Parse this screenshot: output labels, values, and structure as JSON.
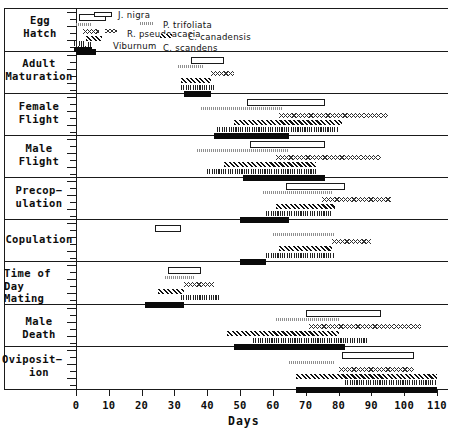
{
  "chart_data": {
    "type": "bar",
    "title": "",
    "xlabel": "Days",
    "ylabel": "",
    "xlim": [
      0,
      112
    ],
    "xticks": [
      0,
      10,
      20,
      30,
      40,
      50,
      60,
      70,
      80,
      90,
      100,
      110
    ],
    "xticklabels": [
      "0",
      "10",
      "20",
      "30",
      "40",
      "50",
      "60",
      "70",
      "80",
      "90",
      "100",
      "110"
    ],
    "grid": false,
    "legend_position": "inside-top-left",
    "orientation": "horizontal-ranges",
    "note": "Gantt-style horizontal range bars: each life-history event row holds one bar per host plant species.",
    "categories": [
      "Egg Hatch",
      "Adult Maturation",
      "Female Flight",
      "Male Flight",
      "Precopulation",
      "Copulation",
      "Time of Day Mating",
      "Male Death",
      "Oviposition"
    ],
    "series": [
      {
        "name": "J. nigra",
        "pattern": "open",
        "style_class": "p-open"
      },
      {
        "name": "P. trifoliata",
        "pattern": "stipple",
        "style_class": "p-dot"
      },
      {
        "name": "R. pseudoacacia",
        "pattern": "wavy-open",
        "style_class": "p-wave"
      },
      {
        "name": "C. canadensis",
        "pattern": "diagonal-hatch",
        "style_class": "p-hatch"
      },
      {
        "name": "Viburnum",
        "pattern": "vertical-hatch",
        "style_class": "p-vert"
      },
      {
        "name": "C. scandens",
        "pattern": "solid",
        "style_class": "p-solid"
      }
    ],
    "rows": [
      {
        "category": "Egg Hatch",
        "bands": [
          {
            "series": "J. nigra",
            "start": 1,
            "end": 9
          },
          {
            "series": "P. trifoliata",
            "start": 0,
            "end": 5
          },
          {
            "series": "R. pseudoacacia",
            "start": 2,
            "end": 7
          },
          {
            "series": "C. canadensis",
            "start": 3,
            "end": 8
          },
          {
            "series": "Viburnum",
            "start": 0,
            "end": 5
          },
          {
            "series": "C. scandens",
            "start": 0,
            "end": 6
          }
        ]
      },
      {
        "category": "Adult Maturation",
        "bands": [
          {
            "series": "J. nigra",
            "start": 35,
            "end": 45
          },
          {
            "series": "P. trifoliata",
            "start": 31,
            "end": 39
          },
          {
            "series": "R. pseudoacacia",
            "start": 41,
            "end": 48
          },
          {
            "series": "C. canadensis",
            "start": 32,
            "end": 41
          },
          {
            "series": "Viburnum",
            "start": 32,
            "end": 42
          },
          {
            "series": "C. scandens",
            "start": 33,
            "end": 41
          }
        ]
      },
      {
        "category": "Female Flight",
        "bands": [
          {
            "series": "J. nigra",
            "start": 52,
            "end": 76
          },
          {
            "series": "P. trifoliata",
            "start": 38,
            "end": 63
          },
          {
            "series": "R. pseudoacacia",
            "start": 62,
            "end": 95
          },
          {
            "series": "C. canadensis",
            "start": 48,
            "end": 81
          },
          {
            "series": "Viburnum",
            "start": 43,
            "end": 80
          },
          {
            "series": "C. scandens",
            "start": 42,
            "end": 65
          }
        ]
      },
      {
        "category": "Male Flight",
        "bands": [
          {
            "series": "J. nigra",
            "start": 53,
            "end": 76
          },
          {
            "series": "P. trifoliata",
            "start": 37,
            "end": 65
          },
          {
            "series": "R. pseudoacacia",
            "start": 61,
            "end": 93
          },
          {
            "series": "C. canadensis",
            "start": 45,
            "end": 73
          },
          {
            "series": "Viburnum",
            "start": 40,
            "end": 73
          },
          {
            "series": "C. scandens",
            "start": 51,
            "end": 76
          }
        ]
      },
      {
        "category": "Precopulation",
        "bands": [
          {
            "series": "J. nigra",
            "start": 64,
            "end": 82
          },
          {
            "series": "P. trifoliata",
            "start": 57,
            "end": 78
          },
          {
            "series": "R. pseudoacacia",
            "start": 75,
            "end": 96
          },
          {
            "series": "C. canadensis",
            "start": 61,
            "end": 79
          },
          {
            "series": "Viburnum",
            "start": 58,
            "end": 78
          },
          {
            "series": "C. scandens",
            "start": 50,
            "end": 65
          }
        ]
      },
      {
        "category": "Copulation",
        "bands": [
          {
            "series": "J. nigra",
            "start": 24,
            "end": 32
          },
          {
            "series": "P. trifoliata",
            "start": 60,
            "end": 79
          },
          {
            "series": "R. pseudoacacia",
            "start": 78,
            "end": 90
          },
          {
            "series": "C. canadensis",
            "start": 62,
            "end": 78
          },
          {
            "series": "Viburnum",
            "start": 58,
            "end": 79
          },
          {
            "series": "C. scandens",
            "start": 50,
            "end": 58
          }
        ]
      },
      {
        "category": "Time of Day Mating",
        "bands": [
          {
            "series": "J. nigra",
            "start": 28,
            "end": 38
          },
          {
            "series": "P. trifoliata",
            "start": 27,
            "end": 36
          },
          {
            "series": "R. pseudoacacia",
            "start": 33,
            "end": 42
          },
          {
            "series": "C. canadensis",
            "start": 25,
            "end": 33
          },
          {
            "series": "Viburnum",
            "start": 32,
            "end": 44
          },
          {
            "series": "C. scandens",
            "start": 21,
            "end": 33
          }
        ]
      },
      {
        "category": "Male Death",
        "bands": [
          {
            "series": "J. nigra",
            "start": 70,
            "end": 93
          },
          {
            "series": "P. trifoliata",
            "start": 61,
            "end": 80
          },
          {
            "series": "R. pseudoacacia",
            "start": 71,
            "end": 105
          },
          {
            "series": "C. canadensis",
            "start": 46,
            "end": 80
          },
          {
            "series": "Viburnum",
            "start": 54,
            "end": 89
          },
          {
            "series": "C. scandens",
            "start": 48,
            "end": 82
          }
        ]
      },
      {
        "category": "Oviposition",
        "bands": [
          {
            "series": "J. nigra",
            "start": 81,
            "end": 103
          },
          {
            "series": "P. trifoliata",
            "start": 65,
            "end": 79
          },
          {
            "series": "R. pseudoacacia",
            "start": 80,
            "end": 103
          },
          {
            "series": "C. canadensis",
            "start": 67,
            "end": 110
          },
          {
            "series": "Viburnum",
            "start": 82,
            "end": 110
          },
          {
            "series": "C. scandens",
            "start": 67,
            "end": 110
          }
        ]
      }
    ]
  },
  "axis": {
    "x_title": "Days",
    "x_labels": [
      "0",
      "10",
      "20",
      "30",
      "40",
      "50",
      "60",
      "70",
      "80",
      "90",
      "100",
      "110"
    ]
  },
  "categories": {
    "egg_hatch": {
      "line1": "Egg",
      "line2": "Hatch"
    },
    "adult_mat": {
      "line1": "Adult",
      "line2": "Maturation"
    },
    "female_flight": {
      "line1": "Female",
      "line2": "Flight"
    },
    "male_flight": {
      "line1": "Male",
      "line2": "Flight"
    },
    "precopulation": {
      "line1": "Precop−",
      "line2": "ulation"
    },
    "copulation": {
      "line1": "Copulation",
      "line2": ""
    },
    "time_of_day": {
      "line1": "Time of",
      "line2": "Day",
      "line3": "Mating"
    },
    "male_death": {
      "line1": "Male",
      "line2": "Death"
    },
    "oviposition": {
      "line1": "Oviposit−",
      "line2": "ion"
    }
  },
  "legend": {
    "items": [
      {
        "label": "J. nigra"
      },
      {
        "label": "P. trifoliata"
      },
      {
        "label": "R. pseudoacacia"
      },
      {
        "label": "C. canadensis"
      },
      {
        "label": "Viburnum"
      },
      {
        "label": "C. scandens"
      }
    ]
  },
  "colors": {
    "ink": "#0a0a0a",
    "background": "#ffffff",
    "mid_gray": "#888888"
  }
}
